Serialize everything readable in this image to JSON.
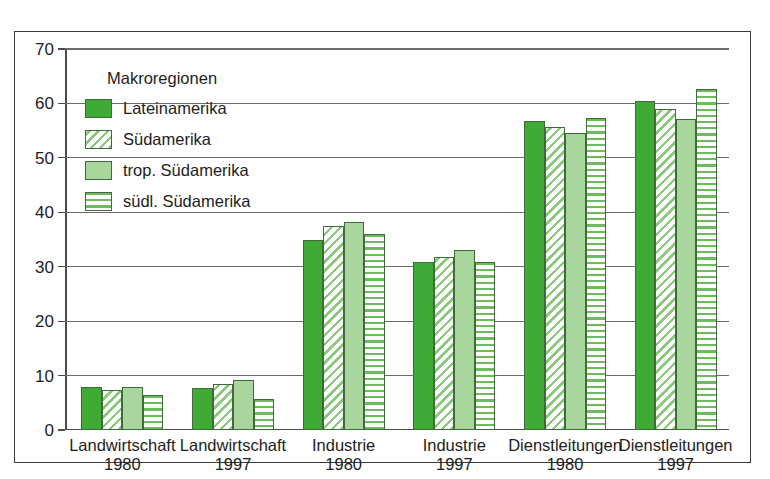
{
  "chart_data": {
    "type": "bar",
    "title": "",
    "xlabel": "",
    "ylabel": "",
    "ylim": [
      0,
      70
    ],
    "yticks": [
      0,
      10,
      20,
      30,
      40,
      50,
      60,
      70
    ],
    "grid": true,
    "legend_position": "top-left-inside",
    "legend_title": "Makroregionen",
    "categories": [
      {
        "line1": "Landwirtschaft",
        "line2": "1980"
      },
      {
        "line1": "Landwirtschaft",
        "line2": "1997"
      },
      {
        "line1": "Industrie",
        "line2": "1980"
      },
      {
        "line1": "Industrie",
        "line2": "1997"
      },
      {
        "line1": "Dienstleitungen",
        "line2": "1980"
      },
      {
        "line1": "Dienstleitungen",
        "line2": "1997"
      }
    ],
    "series": [
      {
        "name": "Lateinamerika",
        "fill": "solid-dark-green",
        "color": "#3faa35",
        "values": [
          7.9,
          7.8,
          34.9,
          30.9,
          56.7,
          60.4
        ]
      },
      {
        "name": "Südamerika",
        "fill": "diagonal-hatch",
        "color": "#8cc97f",
        "values": [
          7.4,
          8.4,
          37.4,
          31.8,
          55.7,
          59.0
        ]
      },
      {
        "name": "trop. Südamerika",
        "fill": "solid-light-green",
        "color": "#a9d69c",
        "values": [
          7.9,
          9.1,
          38.3,
          33.1,
          54.5,
          57.2
        ]
      },
      {
        "name": "südl. Südamerika",
        "fill": "horizontal-stripes",
        "color": "#6cbb5c",
        "values": [
          6.5,
          5.7,
          36.1,
          30.8,
          57.4,
          62.7
        ]
      }
    ]
  }
}
